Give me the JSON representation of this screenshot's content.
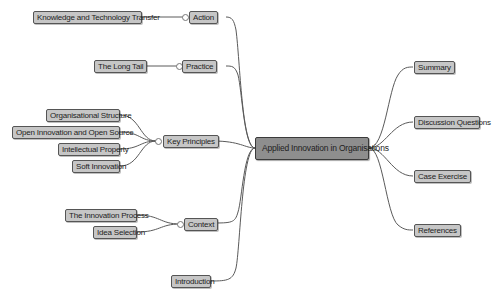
{
  "mindmap": {
    "center": {
      "label": "Applied Innovation in Organisations"
    },
    "left_branches": [
      {
        "label": "Action",
        "children": [
          {
            "label": "Knowledge and Technology Transfer"
          }
        ]
      },
      {
        "label": "Practice",
        "children": [
          {
            "label": "The Long Tail"
          }
        ]
      },
      {
        "label": "Key Principles",
        "children": [
          {
            "label": "Organisational Structure"
          },
          {
            "label": "Open Innovation and Open Source"
          },
          {
            "label": "Intellectual Property"
          },
          {
            "label": "Soft Innovation"
          }
        ]
      },
      {
        "label": "Context",
        "children": [
          {
            "label": "The Innovation Process"
          },
          {
            "label": "Idea Selection"
          }
        ]
      },
      {
        "label": "Introduction",
        "children": []
      }
    ],
    "right_branches": [
      {
        "label": "Summary"
      },
      {
        "label": "Discussion Questions"
      },
      {
        "label": "Case Exercise"
      },
      {
        "label": "References"
      }
    ]
  },
  "colors": {
    "center_fill": "#8e8e8e",
    "node_fill": "#c6c6c6",
    "edge": "#555555"
  }
}
